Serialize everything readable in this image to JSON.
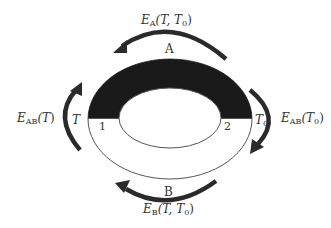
{
  "diagram": {
    "type": "thermocouple-loop",
    "colors": {
      "conductor_a": "#1a1a1a",
      "conductor_b": "#ffffff",
      "outline": "#555555",
      "arrow": "#2a2a2a",
      "text": "#333333"
    },
    "conductors": {
      "a": {
        "label": "A"
      },
      "b": {
        "label": "B"
      }
    },
    "junctions": {
      "j1": {
        "label": "1"
      },
      "j2": {
        "label": "2"
      }
    },
    "temperatures": {
      "left": {
        "base": "T",
        "sub": ""
      },
      "right": {
        "base": "T",
        "sub": "0"
      }
    },
    "emf_labels": {
      "top": {
        "E": "E",
        "sub": "A",
        "args": "(T, T",
        "argsub": "0",
        "close": ")"
      },
      "bottom": {
        "E": "E",
        "sub": "B",
        "args": "(T, T",
        "argsub": "0",
        "close": ")"
      },
      "left": {
        "E": "E",
        "sub": "AB",
        "args": "(T",
        "argsub": "",
        "close": ")"
      },
      "right": {
        "E": "E",
        "sub": "AB",
        "args": "(T",
        "argsub": "0",
        "close": ")"
      }
    }
  }
}
